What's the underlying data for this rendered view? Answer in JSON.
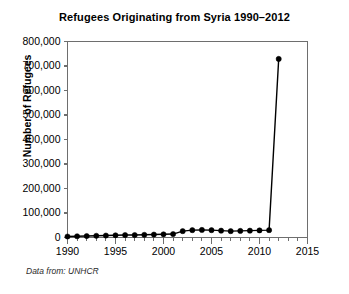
{
  "figure": {
    "title": "Refugees Originating from Syria 1990–2012",
    "source_note": "Data from: UNHCR",
    "background_color": "#ffffff",
    "axis_color": "#6e6e6e",
    "series_color": "#000000"
  },
  "chart_data": {
    "type": "line",
    "title": "Refugees Originating from Syria 1990–2012",
    "xlabel": "",
    "ylabel": "Number of Refugees",
    "xlim": [
      1990,
      2015
    ],
    "ylim": [
      0,
      800000
    ],
    "grid": false,
    "legend": false,
    "x_major_ticks": [
      1990,
      1995,
      2000,
      2005,
      2010,
      2015
    ],
    "x_major_tick_labels": [
      "1990",
      "1995",
      "2000",
      "2005",
      "2010",
      "2015"
    ],
    "x_minor_tick_step": 1,
    "y_ticks": [
      0,
      100000,
      200000,
      300000,
      400000,
      500000,
      600000,
      700000,
      800000
    ],
    "y_tick_labels": [
      "0",
      "100,000",
      "200,000",
      "300,000",
      "400,000",
      "500,000",
      "600,000",
      "700,000",
      "800,000"
    ],
    "marker": "circle",
    "x": [
      1990,
      1991,
      1992,
      1993,
      1994,
      1995,
      1996,
      1997,
      1998,
      1999,
      2000,
      2001,
      2002,
      2003,
      2004,
      2005,
      2006,
      2007,
      2008,
      2009,
      2010,
      2011,
      2012
    ],
    "values": [
      4000,
      5000,
      6000,
      7000,
      8000,
      9000,
      10000,
      10000,
      11000,
      12000,
      13000,
      14000,
      26000,
      30000,
      31000,
      30000,
      28000,
      26000,
      27000,
      28000,
      29000,
      30000,
      729000
    ],
    "series": [
      {
        "name": "Refugees Originating from Syria",
        "values": [
          4000,
          5000,
          6000,
          7000,
          8000,
          9000,
          10000,
          10000,
          11000,
          12000,
          13000,
          14000,
          26000,
          30000,
          31000,
          30000,
          28000,
          26000,
          27000,
          28000,
          29000,
          30000,
          729000
        ]
      }
    ]
  }
}
